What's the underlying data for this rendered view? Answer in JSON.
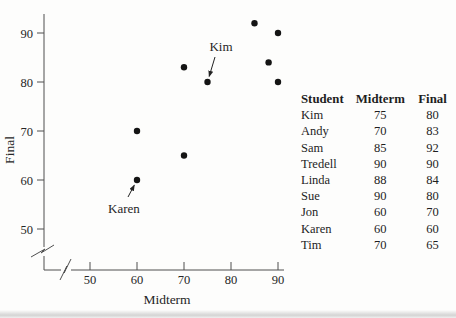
{
  "chart_data": {
    "type": "scatter",
    "title": "",
    "xlabel": "Midterm",
    "ylabel": "Final",
    "x_ticks": [
      "50",
      "60",
      "70",
      "80",
      "90"
    ],
    "y_ticks": [
      "50",
      "60",
      "70",
      "80",
      "90"
    ],
    "x_tick_values": [
      50,
      60,
      70,
      80,
      90
    ],
    "y_tick_values": [
      50,
      60,
      70,
      80,
      90
    ],
    "xlim": [
      45,
      92
    ],
    "ylim": [
      45,
      95
    ],
    "axis_break": true,
    "grid": false,
    "legend": "none",
    "series": [
      {
        "name": "students",
        "points": [
          {
            "label": "Kim",
            "x": 75,
            "y": 80
          },
          {
            "label": "Andy",
            "x": 70,
            "y": 83
          },
          {
            "label": "Sam",
            "x": 85,
            "y": 92
          },
          {
            "label": "Tredell",
            "x": 90,
            "y": 90
          },
          {
            "label": "Linda",
            "x": 88,
            "y": 84
          },
          {
            "label": "Sue",
            "x": 90,
            "y": 80
          },
          {
            "label": "Jon",
            "x": 60,
            "y": 70
          },
          {
            "label": "Karen",
            "x": 60,
            "y": 60
          },
          {
            "label": "Tim",
            "x": 70,
            "y": 65
          }
        ]
      }
    ],
    "annotations": [
      {
        "text": "Kim",
        "x": 75,
        "y": 80
      },
      {
        "text": "Karen",
        "x": 60,
        "y": 60
      }
    ]
  },
  "table": {
    "headers": [
      "Student",
      "Midterm",
      "Final"
    ],
    "rows": [
      [
        "Kim",
        "75",
        "80"
      ],
      [
        "Andy",
        "70",
        "83"
      ],
      [
        "Sam",
        "85",
        "92"
      ],
      [
        "Tredell",
        "90",
        "90"
      ],
      [
        "Linda",
        "88",
        "84"
      ],
      [
        "Sue",
        "90",
        "80"
      ],
      [
        "Jon",
        "60",
        "70"
      ],
      [
        "Karen",
        "60",
        "60"
      ],
      [
        "Tim",
        "70",
        "65"
      ]
    ]
  },
  "colors": {
    "point": "#141414",
    "axis": "#4f4f4f",
    "text": "#262626"
  }
}
